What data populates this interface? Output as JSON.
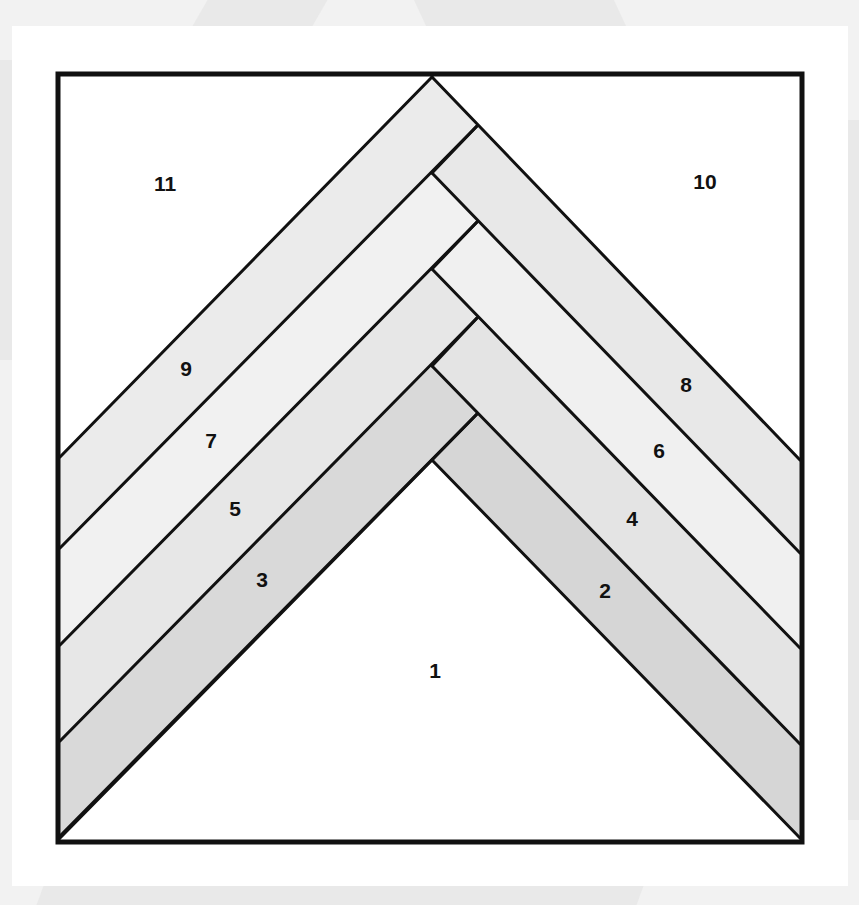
{
  "colors": {
    "outline": "#111111",
    "background": "#ffffff",
    "piece_white": "#ffffff",
    "piece_lightest": "#f1f1f1",
    "piece_light": "#ebebeb",
    "piece_mid": "#e3e3e3",
    "piece_dark": "#d6d6d6"
  },
  "pieces": [
    {
      "number": "1",
      "label": "1",
      "shade": "piece_white",
      "x": 435,
      "y": 672
    },
    {
      "number": "2",
      "label": "2",
      "shade": "piece_dark",
      "x": 605,
      "y": 592
    },
    {
      "number": "3",
      "label": "3",
      "shade": "piece_dark",
      "x": 262,
      "y": 581
    },
    {
      "number": "4",
      "label": "4",
      "shade": "piece_mid",
      "x": 632,
      "y": 520
    },
    {
      "number": "5",
      "label": "5",
      "shade": "piece_mid",
      "x": 235,
      "y": 510
    },
    {
      "number": "6",
      "label": "6",
      "shade": "piece_lightest",
      "x": 659,
      "y": 452
    },
    {
      "number": "7",
      "label": "7",
      "shade": "piece_lightest",
      "x": 211,
      "y": 442
    },
    {
      "number": "8",
      "label": "8",
      "shade": "piece_light",
      "x": 686,
      "y": 386
    },
    {
      "number": "9",
      "label": "9",
      "shade": "piece_light",
      "x": 186,
      "y": 370
    },
    {
      "number": "10",
      "label": "10",
      "shade": "piece_white",
      "x": 705,
      "y": 183
    },
    {
      "number": "11",
      "label": "11",
      "shade": "piece_white",
      "x": 165,
      "y": 185
    }
  ]
}
